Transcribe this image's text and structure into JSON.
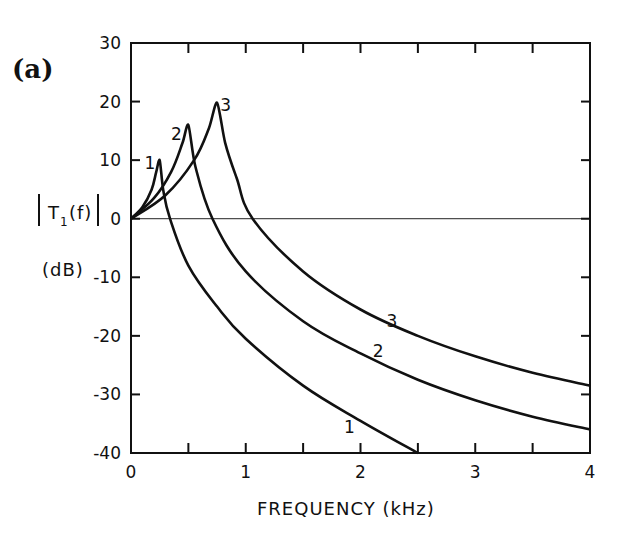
{
  "panel_label": "(a)",
  "ylabel_line1": "|T₁(f)|",
  "ylabel_main": "T",
  "ylabel_sub": "1",
  "ylabel_arg": "(f)",
  "ylabel_unit": "(dB)",
  "xlabel": "FREQUENCY (kHz)",
  "chart_data": {
    "type": "line",
    "title": "(a)",
    "xlabel": "FREQUENCY (kHz)",
    "ylabel": "|T1(f)| (dB)",
    "xlim": [
      0,
      4
    ],
    "ylim": [
      -40,
      30
    ],
    "xticks": [
      0,
      1,
      2,
      3,
      4
    ],
    "xtick_labels": [
      "0",
      "1",
      "2",
      "3",
      "4"
    ],
    "x_minor_ticks": [
      0.5,
      1.5,
      2.5,
      3.5
    ],
    "yticks": [
      30,
      20,
      10,
      0,
      -10,
      -20,
      -30,
      -40
    ],
    "ytick_labels": [
      "30",
      "20",
      "10",
      "0",
      "-10",
      "-20",
      "-30",
      "-40"
    ],
    "reference_line": {
      "y": 0
    },
    "grid": false,
    "legend": "inline curve labels 1, 2, 3",
    "series": [
      {
        "name": "1",
        "x": [
          0,
          0.1,
          0.18,
          0.22,
          0.25,
          0.28,
          0.34,
          0.5,
          0.75,
          1.0,
          1.5,
          2.0,
          2.5
        ],
        "values": [
          0,
          2,
          5,
          8,
          10,
          5,
          0,
          -8,
          -15,
          -20.5,
          -28.5,
          -34.5,
          -40
        ],
        "label_pos": {
          "x": 0.17,
          "y": 9.5,
          "x2": 1.9,
          "y2": -35.5
        }
      },
      {
        "name": "2",
        "x": [
          0,
          0.2,
          0.35,
          0.45,
          0.5,
          0.56,
          0.71,
          1.0,
          1.5,
          2.0,
          2.5,
          3.0,
          3.5,
          4.0
        ],
        "values": [
          0,
          3.5,
          8,
          13,
          16,
          9,
          0,
          -9,
          -17.5,
          -23,
          -27.5,
          -31,
          -33.8,
          -36
        ],
        "label_pos": {
          "x": 0.4,
          "y": 14.5,
          "x2": 2.15,
          "y2": -22.5
        }
      },
      {
        "name": "3",
        "x": [
          0,
          0.3,
          0.55,
          0.68,
          0.75,
          0.82,
          0.92,
          1.06,
          1.5,
          2.0,
          2.5,
          3.0,
          3.5,
          4.0
        ],
        "values": [
          0,
          4,
          10,
          15.5,
          19.8,
          13,
          7,
          0,
          -9,
          -15.5,
          -20,
          -23.5,
          -26.3,
          -28.5
        ],
        "label_pos": {
          "x": 0.83,
          "y": 19.5,
          "x2": 2.27,
          "y2": -17.5
        }
      }
    ]
  }
}
